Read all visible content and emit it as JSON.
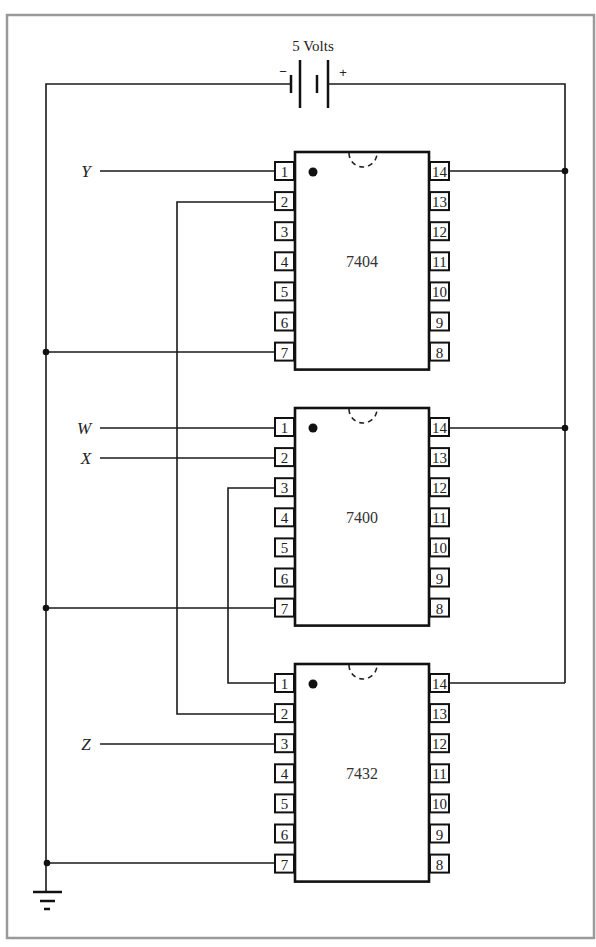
{
  "power": {
    "label": "5 Volts",
    "negative_sign": "−",
    "positive_sign": "+"
  },
  "chips": [
    {
      "id": "7404",
      "label": "7404",
      "top": 152,
      "left_pins": [
        "1",
        "2",
        "3",
        "4",
        "5",
        "6",
        "7"
      ],
      "right_pins": [
        "14",
        "13",
        "12",
        "11",
        "10",
        "9",
        "8"
      ]
    },
    {
      "id": "7400",
      "label": "7400",
      "top": 408,
      "left_pins": [
        "1",
        "2",
        "3",
        "4",
        "5",
        "6",
        "7"
      ],
      "right_pins": [
        "14",
        "13",
        "12",
        "11",
        "10",
        "9",
        "8"
      ]
    },
    {
      "id": "7432",
      "label": "7432",
      "top": 664,
      "left_pins": [
        "1",
        "2",
        "3",
        "4",
        "5",
        "6",
        "7"
      ],
      "right_pins": [
        "14",
        "13",
        "12",
        "11",
        "10",
        "9",
        "8"
      ]
    }
  ],
  "inputs": [
    {
      "name": "Y",
      "chip": "7404",
      "pin": "1"
    },
    {
      "name": "W",
      "chip": "7400",
      "pin": "1"
    },
    {
      "name": "X",
      "chip": "7400",
      "pin": "2"
    },
    {
      "name": "Z",
      "chip": "7432",
      "pin": "3"
    }
  ],
  "connections": [
    {
      "from": "7404 pin 2",
      "to": "7432 pin 2"
    },
    {
      "from": "7400 pin 3",
      "to": "7432 pin 1"
    },
    {
      "from": "7404 pin 14",
      "to": "+5V rail"
    },
    {
      "from": "7400 pin 14",
      "to": "+5V rail"
    },
    {
      "from": "7432 pin 14",
      "to": "+5V rail"
    },
    {
      "from": "7404 pin 7",
      "to": "ground rail"
    },
    {
      "from": "7400 pin 7",
      "to": "ground rail"
    },
    {
      "from": "7432 pin 7",
      "to": "ground rail"
    }
  ],
  "ground": {
    "symbol": "ground-icon"
  },
  "colors": {
    "ink": "#1a1a1a",
    "border": "#9a9a9a",
    "background": "#ffffff"
  }
}
